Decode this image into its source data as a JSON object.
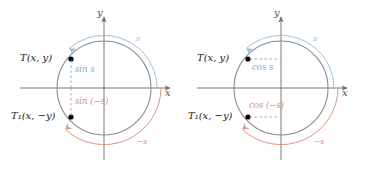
{
  "figure": {
    "background_color": "#ffffff",
    "colors": {
      "circle": "#8a8a8a",
      "axis": "#6b6b6b",
      "positive_arc": "#8fbde0",
      "negative_arc": "#d98a7a",
      "sine_label": "#74a9d8",
      "cosine_label": "#74a9d8",
      "negative_label": "#d98a7a",
      "point": "#000000"
    }
  },
  "panels": [
    {
      "id": "sine-panel",
      "name": "left-sine-diagram",
      "axis_x_label": "x",
      "axis_y_label": "y",
      "point_upper_label": "T(x, y)",
      "point_lower_label": "T₁(x, −y)",
      "segment_upper_label": "sin s",
      "segment_lower_label": "sin (−s)",
      "arc_upper_label": "s",
      "arc_lower_label": "−s",
      "segment_orientation": "vertical"
    },
    {
      "id": "cosine-panel",
      "name": "right-cosine-diagram",
      "axis_x_label": "x",
      "axis_y_label": "y",
      "point_upper_label": "T(x, y)",
      "point_lower_label": "T₁(x, −y)",
      "segment_upper_label": "cos s",
      "segment_lower_label": "cos (−s)",
      "arc_upper_label": "s",
      "arc_lower_label": "−s",
      "segment_orientation": "horizontal"
    }
  ]
}
